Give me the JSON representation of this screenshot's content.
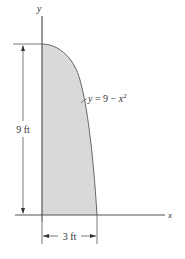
{
  "diagram": {
    "type": "shaded-area-under-curve",
    "axes": {
      "x_label": "x",
      "y_label": "y"
    },
    "curve": {
      "equation_lhs": "y",
      "equation_eq": " = 9 − ",
      "equation_var": "x",
      "equation_exp": "2"
    },
    "dimensions": {
      "height_label": "9 ft",
      "width_label": "3 ft"
    },
    "caption": "",
    "colors": {
      "line": "#555555",
      "fill": "#d9d9d9",
      "text": "#333333",
      "background": "#ffffff"
    }
  }
}
